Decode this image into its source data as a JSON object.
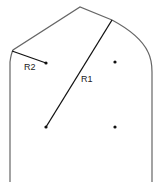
{
  "diagram": {
    "type": "geometric-outline",
    "labels": {
      "r1": "R1",
      "r2": "R2"
    },
    "colors": {
      "outline": "#666666",
      "radius_line": "#111111",
      "dot": "#111111",
      "text": "#222222"
    },
    "points": [
      {
        "name": "center-upper-left",
        "x": 46,
        "y": 63
      },
      {
        "name": "center-upper-right",
        "x": 115,
        "y": 62
      },
      {
        "name": "center-lower-left",
        "x": 46,
        "y": 127
      },
      {
        "name": "center-lower-right",
        "x": 115,
        "y": 127
      }
    ]
  }
}
